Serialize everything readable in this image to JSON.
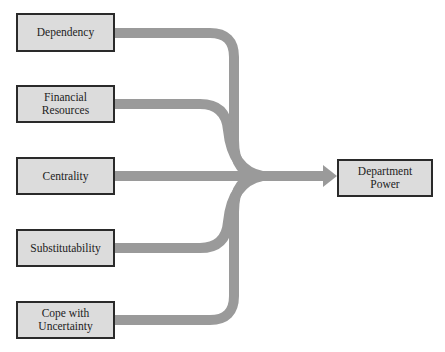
{
  "diagram": {
    "sources": [
      {
        "id": "dependency",
        "label": "Dependency"
      },
      {
        "id": "financial",
        "label": "Financial Resources"
      },
      {
        "id": "centrality",
        "label": "Centrality"
      },
      {
        "id": "substitutability",
        "label": "Substitutability"
      },
      {
        "id": "uncertainty",
        "label": "Cope with Uncertainty"
      }
    ],
    "target": {
      "id": "power",
      "label": "Department Power"
    },
    "colors": {
      "box_fill": "#dcdcdc",
      "box_border": "#2a2a2a",
      "flow": "#9a9a9a",
      "background": "#ffffff"
    }
  }
}
